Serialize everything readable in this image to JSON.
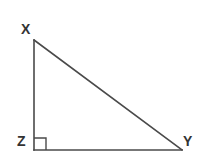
{
  "figure": {
    "name": "right-triangle-xyz",
    "background_color": "#ffffff",
    "stroke_color": "#4a4a4a",
    "label_color": "#333333",
    "stroke_width": 1.6,
    "width": 199,
    "height": 161
  },
  "vertices": [
    {
      "id": "x",
      "label": "X",
      "x": 34,
      "y": 40
    },
    {
      "id": "y",
      "label": "Y",
      "x": 182,
      "y": 150
    },
    {
      "id": "z",
      "label": "Z",
      "x": 34,
      "y": 150
    }
  ],
  "edges": [
    {
      "id": "leg-xz",
      "from": "X",
      "to": "Z",
      "path": "M 34 40 L 34 150"
    },
    {
      "id": "base-zy",
      "from": "Z",
      "to": "Y",
      "path": "M 34 150 L 182 150"
    },
    {
      "id": "hypotenuse-xy",
      "from": "X",
      "to": "Y",
      "path": "M 34 40 L 182 150"
    }
  ],
  "angle_markers": [
    {
      "id": "right-angle-z",
      "at_vertex": "Z",
      "type": "right-angle-square",
      "size": 12,
      "path": "M 34 138 L 46 138 L 46 150"
    }
  ],
  "labels": {
    "x": "X",
    "y": "Y",
    "z": "Z"
  }
}
